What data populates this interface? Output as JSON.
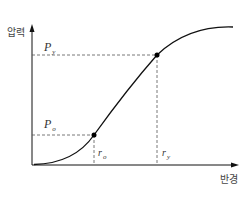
{
  "diagram": {
    "type": "pressure-radius curve",
    "y_axis_label": "압력",
    "x_axis_label": "반경",
    "points": [
      {
        "id": "yield",
        "p_label": "P",
        "p_sub": "y",
        "r_label": "r",
        "r_sub": "y"
      },
      {
        "id": "onset",
        "p_label": "P",
        "p_sub": "o",
        "r_label": "r",
        "r_sub": "o"
      }
    ],
    "colors": {
      "line": "#111111",
      "dash": "#555555",
      "text": "#333333"
    }
  }
}
